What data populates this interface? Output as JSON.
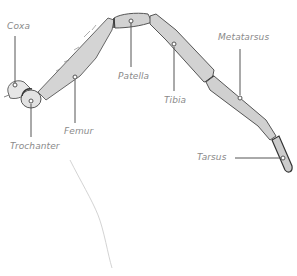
{
  "diagram": {
    "colors": {
      "segment_fill": "#d4d4d4",
      "segment_stroke": "#555555",
      "leader": "#555555",
      "label": "#8a8a8a"
    },
    "labels": {
      "coxa": "Coxa",
      "trochanter": "Trochanter",
      "femur": "Femur",
      "patella": "Patella",
      "tibia": "Tibia",
      "metatarsus": "Metatarsus",
      "tarsus": "Tarsus"
    }
  }
}
